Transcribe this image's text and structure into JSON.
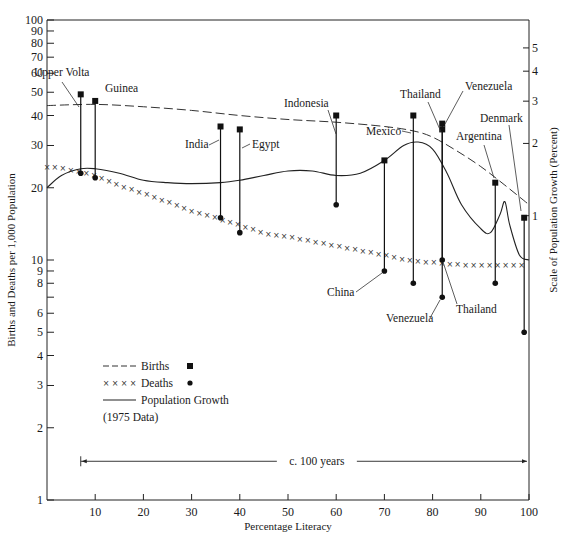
{
  "chart_data": {
    "type": "line",
    "title": "",
    "xlabel": "Percentage Literacy",
    "ylabel": "Births and Deaths per 1,000 Population",
    "ylabel_right": "Scale of Population Growth (Percent)",
    "x_range": [
      0,
      100
    ],
    "y_scale": "log",
    "y_range": [
      1,
      100
    ],
    "y2_scale": "log",
    "y2_ticks": [
      1,
      2,
      3,
      4,
      5
    ],
    "y2_anchor": {
      "percent": 1,
      "left_value": 15.3
    },
    "grid": false,
    "x_ticks": [
      10,
      20,
      30,
      40,
      50,
      60,
      70,
      80,
      90,
      100
    ],
    "y_ticks": [
      1,
      2,
      3,
      4,
      5,
      6,
      7,
      8,
      9,
      10,
      20,
      30,
      40,
      50,
      60,
      70,
      80,
      90,
      100
    ],
    "y_tick_labels": [
      "1",
      "2",
      "3",
      "4",
      "5",
      "6",
      "",
      "8",
      "9",
      "10",
      "20",
      "30",
      "40",
      "50",
      "60",
      "70",
      "80",
      "90",
      "100"
    ],
    "legend": {
      "placement": "bottom-left",
      "entries": [
        {
          "label": "Births",
          "style": "dashed",
          "marker": "square"
        },
        {
          "label": "Deaths",
          "style": "crosses",
          "marker": "dot"
        },
        {
          "label": "Population Growth",
          "style": "solid",
          "marker": ""
        }
      ],
      "note": "(1975 Data)"
    },
    "annotation_span": {
      "label": "c. 100 years",
      "from_x": 7,
      "to_x": 100,
      "y_value": 1.45
    },
    "countries": [
      {
        "name": "Upper Volta",
        "literacy": 7,
        "births": 49,
        "deaths": 23
      },
      {
        "name": "Guinea",
        "literacy": 10,
        "births": 46,
        "deaths": 22
      },
      {
        "name": "India",
        "literacy": 36,
        "births": 36,
        "deaths": 15
      },
      {
        "name": "Egypt",
        "literacy": 40,
        "births": 35,
        "deaths": 13
      },
      {
        "name": "Indonesia",
        "literacy": 60,
        "births": 40,
        "deaths": 17
      },
      {
        "name": "China",
        "literacy": 70,
        "births": 26,
        "deaths": 9
      },
      {
        "name": "Mexico",
        "literacy": 76,
        "births": 40,
        "deaths": 8
      },
      {
        "name": "Thailand",
        "literacy": 82,
        "births": 35,
        "deaths": 10
      },
      {
        "name": "Venezuela",
        "literacy": 82,
        "births": 37,
        "deaths": 7
      },
      {
        "name": "Argentina",
        "literacy": 93,
        "births": 21,
        "deaths": 8
      },
      {
        "name": "Denmark",
        "literacy": 99,
        "births": 15,
        "deaths": 5
      }
    ],
    "series": [
      {
        "name": "Births",
        "style": "dashed",
        "x": [
          0,
          10,
          20,
          30,
          40,
          50,
          60,
          70,
          76,
          80,
          85,
          90,
          95,
          100
        ],
        "values": [
          44,
          44.5,
          43.5,
          42,
          40,
          38.5,
          37.5,
          36,
          34.5,
          32.5,
          28.5,
          24.5,
          20.5,
          17
        ]
      },
      {
        "name": "Deaths",
        "style": "crosses",
        "x": [
          0,
          5,
          10,
          15,
          20,
          25,
          30,
          35,
          40,
          45,
          50,
          55,
          60,
          65,
          70,
          75,
          80,
          85,
          90,
          95,
          100
        ],
        "values": [
          24.5,
          23.8,
          22.5,
          20.5,
          19,
          17.5,
          16,
          15,
          14,
          13,
          12.5,
          12,
          11.5,
          11,
          10.5,
          10,
          9.8,
          9.6,
          9.5,
          9.5,
          9.6
        ]
      },
      {
        "name": "Population Growth",
        "style": "solid",
        "x": [
          0,
          3,
          7,
          10,
          15,
          20,
          25,
          30,
          36,
          40,
          45,
          50,
          55,
          60,
          65,
          70,
          74,
          77,
          80,
          83,
          86,
          90,
          92,
          94,
          95,
          96,
          98,
          100
        ],
        "values": [
          20,
          22.5,
          24,
          24,
          23,
          21.5,
          21,
          20.8,
          21,
          21.5,
          22.5,
          23.5,
          23.5,
          22.5,
          23,
          26,
          30,
          31,
          29,
          23,
          17,
          13.5,
          13,
          15.5,
          17.5,
          14,
          10.5,
          10
        ]
      }
    ],
    "labels": [
      {
        "text": "Upper Volta",
        "key": "upper_volta"
      },
      {
        "text": "Guinea",
        "key": "guinea"
      },
      {
        "text": "India",
        "key": "india"
      },
      {
        "text": "Egypt",
        "key": "egypt"
      },
      {
        "text": "Indonesia",
        "key": "indonesia"
      },
      {
        "text": "Mexico",
        "key": "mexico"
      },
      {
        "text": "Thailand",
        "key": "thailand_top"
      },
      {
        "text": "Venezuela",
        "key": "venezuela_top"
      },
      {
        "text": "Argentina",
        "key": "argentina"
      },
      {
        "text": "Denmark",
        "key": "denmark"
      },
      {
        "text": "China",
        "key": "china"
      },
      {
        "text": "Venezuela",
        "key": "venezuela_bottom"
      },
      {
        "text": "Thailand",
        "key": "thailand_bottom"
      }
    ]
  }
}
